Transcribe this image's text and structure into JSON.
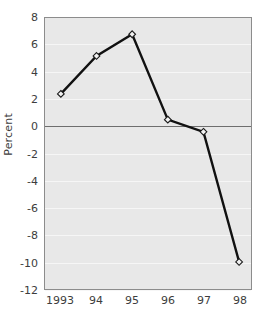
{
  "chart_data": {
    "type": "line",
    "title": "",
    "xlabel": "",
    "ylabel": "Percent",
    "categories": [
      "1993",
      "94",
      "95",
      "96",
      "97",
      "98"
    ],
    "x_values": [
      1993,
      1994,
      1995,
      1996,
      1997,
      1998
    ],
    "values": [
      2.4,
      5.2,
      6.8,
      0.5,
      -0.4,
      -10.0
    ],
    "series": [
      {
        "name": "Percent",
        "values": [
          2.4,
          5.2,
          6.8,
          0.5,
          -0.4,
          -10.0
        ]
      }
    ],
    "ylim": [
      -12,
      8
    ],
    "xlim": [
      1992.7,
      1998.3
    ],
    "y_ticks": [
      8,
      6,
      4,
      2,
      0,
      -2,
      -4,
      -6,
      -8,
      -10,
      -12
    ],
    "y_tick_labels": [
      "8",
      "6",
      "4",
      "2",
      "0",
      "-2",
      "-4",
      "-6",
      "-8",
      "-10",
      "-12"
    ],
    "x_tick_labels": [
      "1993",
      "94",
      "95",
      "96",
      "97",
      "98"
    ],
    "grid": true,
    "grid_orientation": "horizontal",
    "zero_line": true,
    "legend": false,
    "legend_position": "none",
    "marker": "diamond",
    "colors": {
      "plot_background": "#e8e8e8",
      "gridline": "#f6f6f6",
      "zero_line": "#6e6e6e",
      "frame": "#8c8c8c",
      "series_line": "#111111",
      "marker_fill": "#f2f2f2",
      "marker_stroke": "#1a1a1a",
      "tick_text": "#3d3d3d",
      "page_background": "#ffffff"
    }
  }
}
